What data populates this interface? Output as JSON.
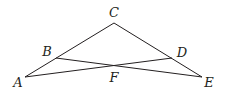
{
  "diagram": {
    "type": "geometry",
    "points": {
      "A": {
        "x": 25,
        "y": 77,
        "label": "A",
        "label_x": 18,
        "label_y": 87
      },
      "B": {
        "x": 56,
        "y": 58,
        "label": "B",
        "label_x": 47,
        "label_y": 56
      },
      "C": {
        "x": 114,
        "y": 23,
        "label": "C",
        "label_x": 114,
        "label_y": 17
      },
      "D": {
        "x": 172,
        "y": 58,
        "label": "D",
        "label_x": 182,
        "label_y": 57
      },
      "E": {
        "x": 202,
        "y": 77,
        "label": "E",
        "label_x": 209,
        "label_y": 87
      },
      "F": {
        "x": 114,
        "y": 65,
        "label": "F",
        "label_x": 114,
        "label_y": 82
      }
    },
    "segments": [
      [
        "A",
        "C"
      ],
      [
        "C",
        "E"
      ],
      [
        "B",
        "E"
      ],
      [
        "A",
        "D"
      ]
    ],
    "colors": {
      "stroke": "#231f20",
      "text": "#231f20",
      "background": "#ffffff"
    }
  }
}
